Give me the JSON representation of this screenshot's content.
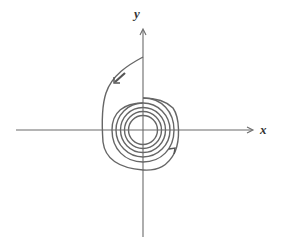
{
  "diagram": {
    "type": "phase-portrait",
    "axes": {
      "x_label": "x",
      "y_label": "y"
    },
    "colors": {
      "axis": "#6b6b6b",
      "curve": "#666666",
      "label": "#333333",
      "background": "#ffffff"
    },
    "arrows": [
      {
        "location": "upper-left segment",
        "direction": "down-left"
      },
      {
        "location": "lower-right segment",
        "direction": "up-right"
      }
    ]
  }
}
